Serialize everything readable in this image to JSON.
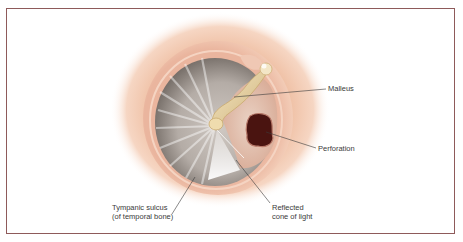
{
  "figure": {
    "frame_color": "#8e5a5a",
    "labels": {
      "malleus": "Malleus",
      "perforation": "Perforation",
      "tympanic_sulcus_line1": "Tympanic sulcus",
      "tympanic_sulcus_line2": "(of temporal bone)",
      "cone_of_light_line1": "Reflected",
      "cone_of_light_line2": "cone of light"
    },
    "colors": {
      "ear_canal_skin": "#f0c2a4",
      "sulcus_ring": "#e9b49c",
      "membrane": "#b9b2ad",
      "malleus": "#e8d3a0",
      "perforation": "#4a1410",
      "leader_line": "#3b3b3b"
    }
  }
}
